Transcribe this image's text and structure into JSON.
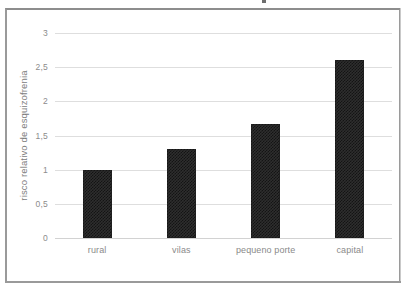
{
  "chart_data": {
    "type": "bar",
    "title": "",
    "xlabel": "",
    "ylabel": "risco relativo de esquizofrenia",
    "categories": [
      "rural",
      "vilas",
      "pequeno porte",
      "capital"
    ],
    "values": [
      1,
      1.3,
      1.67,
      2.6
    ],
    "ylim": [
      0,
      3
    ],
    "ytick_labels": [
      "3",
      "2,5",
      "2",
      "1,5",
      "1",
      "0,5",
      "0"
    ],
    "ytick_values": [
      3,
      2.5,
      2,
      1.5,
      1,
      0.5,
      0
    ],
    "grid": true,
    "legend": false,
    "series": [
      {
        "name": "risco relativo de esquizofrenia",
        "values": [
          1,
          1.3,
          1.67,
          2.6
        ]
      }
    ],
    "colors": {
      "bar_fill": "#2e2e2e",
      "bar_pattern": "#141414",
      "gridline": "#dedede",
      "axis_text": "#8a8a8a",
      "frame_border": "#9a9a9a",
      "background": "#ffffff"
    }
  }
}
